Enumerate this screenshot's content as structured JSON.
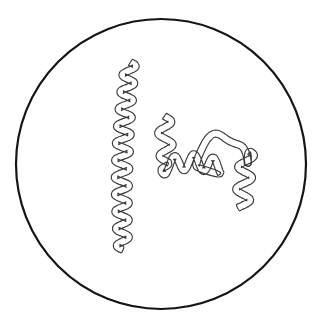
{
  "figure": {
    "background_color": "#ffffff",
    "canvas": {
      "width": 326,
      "height": 328
    }
  },
  "petri_dish": {
    "name": "circular field of view",
    "center_x": 161,
    "center_y": 164,
    "radius": 145,
    "stroke_color": "#151515",
    "stroke_width": 2.2,
    "fill_color": "#ffffff"
  },
  "organisms": [
    {
      "id": "spirochete-left",
      "label": "Left spirochete",
      "description": "Long vertical helical bacterium with regular tight coils, running top to bottom with a leftward drift",
      "stroke_color": "#3a3a3a",
      "stroke_width": 1.15,
      "tube_width": 7,
      "head_x": 130,
      "head_y": 62,
      "tail_x": 123,
      "tail_y": 250,
      "wave_count": 11,
      "outline_a": "M131.5,62.2 C136.8,61.0 140.4,64.8 140.0,69.3 C139.6,73.8 135.1,76.3 132.6,79.2 C130.0,82.2 130.4,85.7 133.5,87.5 C136.9,89.5 141.0,90.6 141.6,95.1 C142.2,99.6 138.0,102.3 134.8,104.6 C131.6,106.9 130.5,110.0 133.0,112.6 C135.6,115.3 139.4,117.2 139.5,121.6 C139.6,126.0 135.6,128.6 132.8,131.3 C130.0,134.0 129.3,137.5 131.8,140.2 C134.3,143.0 137.5,145.6 136.9,150.0 C136.3,154.4 132.0,156.4 129.0,158.8 C126.0,161.2 124.9,164.6 127.2,167.5 C129.5,170.4 132.6,173.2 131.6,177.5 C130.6,181.8 126.2,183.4 123.1,185.6 C120.0,187.8 118.7,191.2 120.8,194.2 C122.9,197.3 125.9,200.3 124.5,204.4 C123.1,208.5 118.7,209.8 115.7,211.8 C112.7,213.8 111.4,217.2 113.4,220.4 C115.4,223.6 118.3,226.8 116.7,230.8 C115.1,234.8 110.6,235.8 107.8,237.9 C105.0,240.0 104.1,243.4 106.5,246.2 C109.0,249.1 113.0,251.0 117.5,250.6 C122.4,250.2 126.2,246.8 126.4,242.2",
      "outline_b": "M126.4,242.2 C126.6,238.6 123.8,236.6 121.2,235.0 C118.6,233.4 116.8,231.0 117.6,228.0 C118.4,225.0 121.6,223.2 124.2,221.2 C126.8,219.2 128.4,216.6 127.3,213.6 C126.2,210.6 123.0,208.6 120.7,206.5 C118.4,204.4 117.3,201.6 118.6,198.8 C119.9,196.0 123.2,194.2 125.8,192.2 C128.4,190.2 130.0,187.5 128.8,184.6 C127.6,181.7 124.3,179.8 122.0,177.6 C119.7,175.4 118.7,172.6 120.1,169.8 C121.5,167.0 124.9,165.2 127.5,163.0 C130.1,160.8 131.5,158.0 130.2,155.2 C128.9,152.4 125.5,150.6 123.2,148.4 C120.9,146.2 120.0,143.4 121.5,140.7 C123.0,138.0 126.4,136.4 129.0,134.2 C131.6,132.0 132.9,129.2 131.5,126.5 C130.1,123.8 126.6,122.2 124.3,120.0 C122.0,117.8 121.2,115.0 122.8,112.4 C124.4,109.8 127.9,108.4 130.5,106.3 C133.1,104.2 134.3,101.4 132.8,98.8 C131.3,96.2 127.7,94.8 125.4,92.7 C123.1,90.6 122.4,87.8 124.1,85.3 C125.8,82.8 129.4,81.6 132.0,79.5 C134.6,77.4 135.7,74.6 134.1,72.1 C132.5,69.6 128.9,68.4 126.9,66.2 C125.0,64.1 125.5,61.8 127.6,60.6 C129.0,59.8 130.4,59.9 131.5,62.2"
    },
    {
      "id": "spirochete-right",
      "label": "Right spirochete",
      "description": "Branching serpentine bacterium that coils down from upper left, waves rightward, arches over a dome and descends in a wavy tail at right",
      "stroke_color": "#3a3a3a",
      "stroke_width": 1.15,
      "tube_width": 7,
      "head_x": 165,
      "head_y": 116,
      "tail_x": 242,
      "tail_y": 208,
      "wave_count": 13,
      "outline_a": "M166.5,116.4 C172.6,115.6 176.6,119.6 175.6,124.3 C174.6,129.0 169.2,130.6 166.6,133.4 C164.0,136.2 164.8,139.4 168.0,141.0 C171.2,142.6 174.4,144.6 174.2,148.4 C174.0,152.2 170.0,154.2 166.8,156.0 C163.6,157.8 162.4,160.8 164.8,163.2 C167.2,165.6 170.4,167.8 169.4,171.2 C168.4,174.6 164.4,175.8 161.2,176.4 C158.0,177.0 155.4,175.8 154.8,173.0 C154.2,170.2 156.0,167.8 158.6,166.4 C161.2,165.0 164.4,165.4 167.0,167.2 C169.8,169.2 171.4,172.6 174.6,174.2 C177.8,175.8 181.2,174.8 183.0,172.0 C184.8,169.2 184.6,165.6 186.6,163.0 C188.6,160.4 192.0,159.8 194.6,161.4 C197.2,163.0 198.4,166.2 200.8,168.0 C203.2,169.8 206.4,169.4 208.2,167.0 C210.0,164.6 210.0,161.2 211.8,158.8 C213.6,156.4 216.8,155.8 219.2,157.4 C221.6,159.0 222.6,162.2 225.2,163.4 C227.8,164.6 230.6,163.4 231.6,160.8 C232.6,158.2 231.8,155.2 233.4,152.8 C235.0,150.4 238.2,149.8 240.4,151.4 C242.6,153.0 243.4,156.0 245.6,157.8 C247.4,159.2 249.6,159.4 251.2,158.0",
      "outline_b": "M251.2,158.0 C253.4,156.0 252.6,152.4 250.6,150.2 C248.6,148.0 245.4,146.8 243.8,144.2 C242.2,141.6 242.8,138.4 244.8,136.2 C246.8,134.0 249.8,133.0 251.4,130.6 C253.0,128.2 252.4,125.0 250.2,123.2 C248.0,121.4 244.8,121.4 242.6,119.6 C240.4,117.8 239.6,114.6 240.8,112.0 C242.0,109.4 244.8,108.0 246.0,105.4",
      "arch_note": "dome over right side"
    }
  ],
  "annotations": {
    "caption": ""
  },
  "colors": {
    "stroke_dark": "#151515",
    "stroke_organism": "#3a3a3a",
    "background": "#ffffff"
  }
}
